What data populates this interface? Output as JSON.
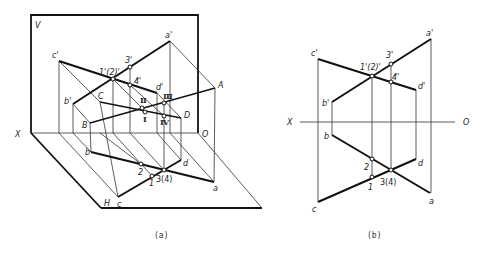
{
  "figure_a": {
    "caption": "(a)",
    "plane_labels": {
      "V": "V",
      "H": "H",
      "X": "X",
      "O": "O"
    },
    "projection_labels": {
      "c_prime": "c'",
      "a_prime": "a'",
      "b_prime": "b'",
      "d_prime": "d'",
      "p12_prime": "1'(2)'",
      "p3_prime": "3'",
      "p4_prime": "4'",
      "b": "b",
      "c": "c",
      "a": "a",
      "d": "d",
      "p2": "2",
      "p1": "1",
      "p34": "3(4)"
    },
    "space_labels": {
      "A": "A",
      "B": "B",
      "C": "C",
      "D": "D",
      "I": "Ⅰ",
      "II": "Ⅱ",
      "III": "Ⅲ",
      "IV": "Ⅳ"
    }
  },
  "figure_b": {
    "caption": "(b)",
    "axis_labels": {
      "X": "X",
      "O": "O"
    },
    "projection_labels": {
      "c_prime": "c'",
      "a_prime": "a'",
      "b_prime": "b'",
      "d_prime": "d'",
      "p12_prime": "1'(2)'",
      "p3_prime": "3'",
      "p4_prime": "4'",
      "b": "b",
      "c": "c",
      "a": "a",
      "d": "d",
      "p2": "2",
      "p1": "1",
      "p34": "3(4)"
    }
  }
}
